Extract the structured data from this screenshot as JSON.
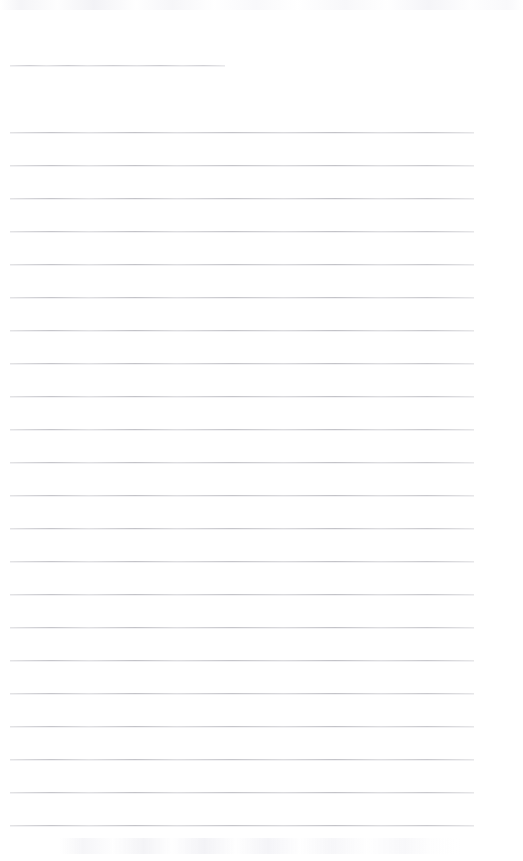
{
  "document": {
    "kind": "scanned-lined-notebook-page",
    "title": "Blank Lined Notebook Page",
    "page_width": 523,
    "page_height": 861,
    "background_color": "#ffffff",
    "rule_color": "#b9b9bf",
    "content_text": "",
    "has_handwriting": false,
    "line_count": 24,
    "line_spacing_px": 32.6,
    "left_margin_px": 10,
    "right_edge_px": 474
  },
  "artifacts": {
    "top_band_label": "scanner-edge-artifact",
    "bottom_ghost_label": "bleed-through-ghost"
  },
  "rules": [
    {
      "index": 1,
      "y": 65,
      "x": 10,
      "width": 215
    },
    {
      "index": 2,
      "y": 132,
      "x": 10,
      "width": 464
    },
    {
      "index": 3,
      "y": 165,
      "x": 10,
      "width": 464
    },
    {
      "index": 4,
      "y": 198,
      "x": 10,
      "width": 464
    },
    {
      "index": 5,
      "y": 231,
      "x": 10,
      "width": 464
    },
    {
      "index": 6,
      "y": 264,
      "x": 10,
      "width": 464
    },
    {
      "index": 7,
      "y": 297,
      "x": 10,
      "width": 464
    },
    {
      "index": 8,
      "y": 330,
      "x": 10,
      "width": 464
    },
    {
      "index": 9,
      "y": 363,
      "x": 10,
      "width": 464
    },
    {
      "index": 10,
      "y": 396,
      "x": 10,
      "width": 464
    },
    {
      "index": 11,
      "y": 429,
      "x": 10,
      "width": 464
    },
    {
      "index": 12,
      "y": 462,
      "x": 10,
      "width": 464
    },
    {
      "index": 13,
      "y": 495,
      "x": 10,
      "width": 464
    },
    {
      "index": 14,
      "y": 528,
      "x": 10,
      "width": 464
    },
    {
      "index": 15,
      "y": 561,
      "x": 10,
      "width": 464
    },
    {
      "index": 16,
      "y": 594,
      "x": 10,
      "width": 464
    },
    {
      "index": 17,
      "y": 627,
      "x": 10,
      "width": 464
    },
    {
      "index": 18,
      "y": 660,
      "x": 10,
      "width": 464
    },
    {
      "index": 19,
      "y": 693,
      "x": 10,
      "width": 464
    },
    {
      "index": 20,
      "y": 726,
      "x": 10,
      "width": 464
    },
    {
      "index": 21,
      "y": 759,
      "x": 10,
      "width": 464
    },
    {
      "index": 22,
      "y": 792,
      "x": 10,
      "width": 464
    },
    {
      "index": 23,
      "y": 825,
      "x": 10,
      "width": 464
    }
  ]
}
